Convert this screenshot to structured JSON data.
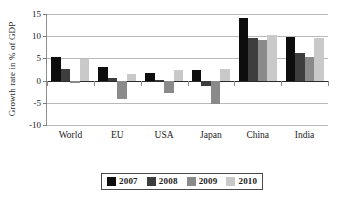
{
  "chart_data": {
    "type": "bar",
    "title": "",
    "subtitle": "",
    "xlabel": "",
    "ylabel": "Growth rate in % of GDP",
    "categories": [
      "World",
      "EU",
      "USA",
      "Japan",
      "China",
      "India"
    ],
    "series": [
      {
        "name": "2007",
        "color": "#0d0d0d",
        "values": [
          5.3,
          3.1,
          1.8,
          2.3,
          14.2,
          9.8
        ]
      },
      {
        "name": "2008",
        "color": "#3d3d3d",
        "values": [
          2.7,
          0.5,
          0.1,
          -1.2,
          9.6,
          6.3
        ]
      },
      {
        "name": "2009",
        "color": "#8a8a8a",
        "values": [
          -0.6,
          -4.2,
          -2.8,
          -5.3,
          9.1,
          5.4
        ]
      },
      {
        "name": "2010",
        "color": "#c9c9c9",
        "values": [
          4.8,
          1.5,
          2.4,
          2.7,
          10.3,
          9.5
        ]
      }
    ],
    "ylim": [
      -10,
      15
    ],
    "yticks": [
      "15",
      "10",
      "5",
      "0",
      "-5",
      "-10"
    ],
    "ytick_values": [
      15,
      10,
      5,
      0,
      -5,
      -10
    ],
    "grid": true,
    "legend_position": "bottom"
  },
  "legend": {
    "entries": [
      {
        "label": "2007"
      },
      {
        "label": "2008"
      },
      {
        "label": "2009"
      },
      {
        "label": "2010"
      }
    ]
  }
}
